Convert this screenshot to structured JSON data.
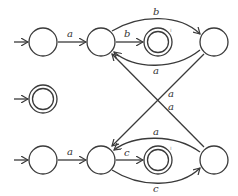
{
  "diagram": {
    "type": "finite-automaton",
    "colors": {
      "stroke": "#3a3a3a",
      "label": "#333333",
      "background": "#ffffff"
    },
    "states": [
      {
        "id": "q0",
        "accepting": false,
        "initial": true
      },
      {
        "id": "q1",
        "accepting": false,
        "initial": false
      },
      {
        "id": "q2",
        "accepting": true,
        "initial": false
      },
      {
        "id": "q3",
        "accepting": false,
        "initial": false
      },
      {
        "id": "q4",
        "accepting": true,
        "initial": true
      },
      {
        "id": "q5",
        "accepting": false,
        "initial": true
      },
      {
        "id": "q6",
        "accepting": false,
        "initial": false
      },
      {
        "id": "q7",
        "accepting": true,
        "initial": false
      },
      {
        "id": "q8",
        "accepting": false,
        "initial": false
      }
    ],
    "transitions": [
      {
        "from": "q0",
        "to": "q1",
        "label": "a"
      },
      {
        "from": "q1",
        "to": "q2",
        "label": "b"
      },
      {
        "from": "q1",
        "to": "q3",
        "label": "b"
      },
      {
        "from": "q3",
        "to": "q1",
        "label": "a"
      },
      {
        "from": "q3",
        "to": "q6",
        "label": "a"
      },
      {
        "from": "q5",
        "to": "q6",
        "label": "a"
      },
      {
        "from": "q6",
        "to": "q7",
        "label": "c"
      },
      {
        "from": "q6",
        "to": "q8",
        "label": "c"
      },
      {
        "from": "q8",
        "to": "q6",
        "label": "a"
      },
      {
        "from": "q8",
        "to": "q1",
        "label": "a"
      }
    ],
    "labels": {
      "q0_q1": "a",
      "q1_q2": "b",
      "q1_q3": "b",
      "q3_q1": "a",
      "q3_q6": "a",
      "q8_q1": "a",
      "q5_q6": "a",
      "q6_q7": "c",
      "q6_q8": "c",
      "q8_q6": "a",
      "mark_top": "ı",
      "mark_bottom": "ı"
    }
  }
}
